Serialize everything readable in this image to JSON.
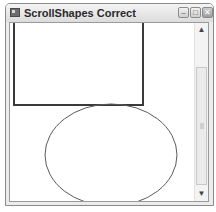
{
  "window": {
    "title": "ScrollShapes Correct",
    "buttons": {
      "minimize": "–",
      "maximize": "□",
      "close": "✕"
    }
  },
  "canvas": {
    "shapes": [
      {
        "type": "rectangle",
        "x": 4,
        "y": -20,
        "width": 129,
        "height": 102,
        "stroke": "#3a3a3a",
        "stroke_width": 2
      },
      {
        "type": "ellipse",
        "cx": 101,
        "cy": 132,
        "rx": 66,
        "ry": 51,
        "stroke": "#5a5a5a",
        "stroke_width": 1
      }
    ]
  },
  "scrollbar": {
    "orientation": "vertical",
    "up_arrow": "▲",
    "down_arrow": "▼"
  }
}
